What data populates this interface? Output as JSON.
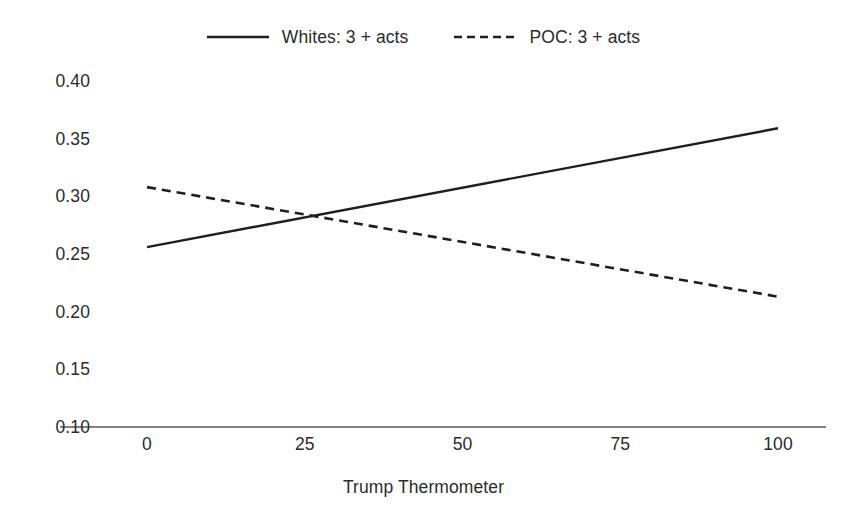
{
  "chart_data": {
    "type": "line",
    "title": "",
    "xlabel": "Trump Thermometer",
    "ylabel": "",
    "xlim": [
      0,
      100
    ],
    "ylim": [
      0.1,
      0.4
    ],
    "grid": false,
    "legend_position": "top-center",
    "x_ticks": [
      "0",
      "25",
      "50",
      "75",
      "100"
    ],
    "x_tick_values": [
      0,
      25,
      50,
      75,
      100
    ],
    "y_ticks": [
      "0.40",
      "0.35",
      "0.30",
      "0.25",
      "0.20",
      "0.15",
      "0.10"
    ],
    "y_tick_values": [
      0.4,
      0.35,
      0.3,
      0.25,
      0.2,
      0.15,
      0.1
    ],
    "x": [
      0,
      100
    ],
    "series": [
      {
        "name": "Whites: 3 + acts",
        "style": "solid",
        "color": "#1f1f1f",
        "values": [
          0.256,
          0.359
        ]
      },
      {
        "name": "POC: 3 + acts",
        "style": "dashed",
        "color": "#1f1f1f",
        "values": [
          0.308,
          0.213
        ]
      }
    ],
    "annotations": [
      {
        "note": "series intersect",
        "x": 27,
        "y": 0.283
      }
    ]
  },
  "legend": {
    "entries": [
      {
        "label": "Whites: 3 + acts",
        "style": "solid"
      },
      {
        "label": "POC: 3 + acts",
        "style": "dashed"
      }
    ]
  },
  "axes": {
    "x_title": "Trump Thermometer",
    "x_tick_labels": [
      "0",
      "25",
      "50",
      "75",
      "100"
    ],
    "y_tick_labels": [
      "0.40",
      "0.35",
      "0.30",
      "0.25",
      "0.20",
      "0.15",
      "0.10"
    ]
  },
  "colors": {
    "background": "#ffffff",
    "ink": "#2b2b2b",
    "line": "#1f1f1f",
    "axis": "#5a5a5a"
  }
}
